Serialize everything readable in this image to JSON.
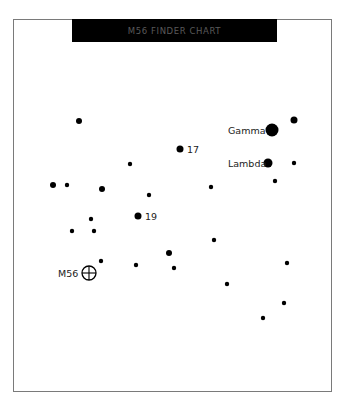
{
  "chart": {
    "title": "M56 FINDER CHART",
    "colors": {
      "background": "#ffffff",
      "frame": "#7a7a7a",
      "title_bar": "#000000",
      "title_text": "#5a5a5a",
      "star": "#000000"
    }
  },
  "labels": {
    "gamma": "Gamma",
    "lambda": "Lambda",
    "star17": "17",
    "star19": "19",
    "m56": "M56"
  },
  "chart_data": {
    "type": "scatter",
    "title": "M56 FINDER CHART",
    "xlabel": "",
    "ylabel": "",
    "grid": false,
    "legend": null,
    "points": [
      {
        "x": 79,
        "y": 121,
        "r": 3,
        "label": ""
      },
      {
        "x": 294,
        "y": 120,
        "r": 3.5,
        "label": ""
      },
      {
        "x": 272,
        "y": 130,
        "r": 6.5,
        "label": "Gamma"
      },
      {
        "x": 180,
        "y": 149,
        "r": 3.5,
        "label": "17"
      },
      {
        "x": 130,
        "y": 164,
        "r": 2.2,
        "label": ""
      },
      {
        "x": 268,
        "y": 163,
        "r": 4.5,
        "label": "Lambda"
      },
      {
        "x": 294,
        "y": 163,
        "r": 2.2,
        "label": ""
      },
      {
        "x": 275,
        "y": 181,
        "r": 2.2,
        "label": ""
      },
      {
        "x": 211,
        "y": 187,
        "r": 2.2,
        "label": ""
      },
      {
        "x": 53,
        "y": 185,
        "r": 3,
        "label": ""
      },
      {
        "x": 67,
        "y": 185,
        "r": 2.2,
        "label": ""
      },
      {
        "x": 102,
        "y": 189,
        "r": 3,
        "label": ""
      },
      {
        "x": 149,
        "y": 195,
        "r": 2.2,
        "label": ""
      },
      {
        "x": 138,
        "y": 216,
        "r": 3.5,
        "label": "19"
      },
      {
        "x": 91,
        "y": 219,
        "r": 2.2,
        "label": ""
      },
      {
        "x": 72,
        "y": 231,
        "r": 2.2,
        "label": ""
      },
      {
        "x": 94,
        "y": 231,
        "r": 2.2,
        "label": ""
      },
      {
        "x": 214,
        "y": 240,
        "r": 2.2,
        "label": ""
      },
      {
        "x": 169,
        "y": 253,
        "r": 3,
        "label": ""
      },
      {
        "x": 101,
        "y": 261,
        "r": 2.2,
        "label": ""
      },
      {
        "x": 136,
        "y": 265,
        "r": 2.2,
        "label": ""
      },
      {
        "x": 174,
        "y": 268,
        "r": 2.2,
        "label": ""
      },
      {
        "x": 287,
        "y": 263,
        "r": 2.2,
        "label": ""
      },
      {
        "x": 227,
        "y": 284,
        "r": 2.2,
        "label": ""
      },
      {
        "x": 284,
        "y": 303,
        "r": 2.2,
        "label": ""
      },
      {
        "x": 263,
        "y": 318,
        "r": 2.2,
        "label": ""
      }
    ],
    "target": {
      "x": 89,
      "y": 273,
      "r": 7,
      "label": "M56",
      "symbol": "circle-crosshair"
    }
  }
}
